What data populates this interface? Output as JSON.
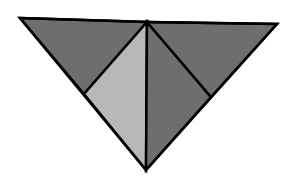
{
  "diagram": {
    "title": "",
    "colors": {
      "background": "#ffffff",
      "dark": "#6e6e6e",
      "light": "#b8b8b8",
      "stroke": "#000000"
    },
    "vertices": {
      "top_left": [
        20,
        18
      ],
      "top_mid": [
        147,
        22
      ],
      "top_right": [
        277,
        24
      ],
      "bottom": [
        146,
        170
      ],
      "left_mid": [
        84,
        94
      ],
      "right_mid": [
        211,
        97
      ]
    },
    "pieces": [
      {
        "name": "top-left-dark-triangle",
        "fill": "dark",
        "points": "20,18 147,22 84,94"
      },
      {
        "name": "left-light-triangle",
        "fill": "light",
        "points": "84,94 147,22 146,170"
      },
      {
        "name": "right-dark-triangle",
        "fill": "dark",
        "points": "147,22 211,97 146,170"
      },
      {
        "name": "top-right-dark-triangle",
        "fill": "dark",
        "points": "147,22 277,24 211,97"
      }
    ],
    "stroke_width": 2.5
  }
}
